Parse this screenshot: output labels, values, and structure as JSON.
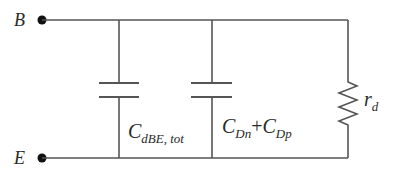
{
  "diagram": {
    "type": "equivalent-circuit",
    "colors": {
      "wire": "#555555",
      "text": "#2a2a2a",
      "node": "#111111",
      "background": "#ffffff"
    },
    "terminals": {
      "top": {
        "label": "B"
      },
      "bottom": {
        "label": "E"
      }
    },
    "components": [
      {
        "kind": "capacitor",
        "symbol": "C",
        "subscript": "dBE, tot"
      },
      {
        "kind": "capacitor",
        "symbol1": "C",
        "subscript1": "Dn",
        "operator": "+",
        "symbol2": "C",
        "subscript2": "Dp"
      },
      {
        "kind": "resistor",
        "symbol": "r",
        "subscript": "d"
      }
    ]
  }
}
